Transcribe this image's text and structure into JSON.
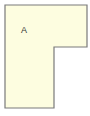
{
  "diagram": {
    "shape": "L-shape",
    "label": "A",
    "fill_color": "#fdfde0",
    "stroke_color": "#7a7a7a",
    "points": [
      [
        5,
        5
      ],
      [
        87,
        5
      ],
      [
        87,
        47
      ],
      [
        54,
        47
      ],
      [
        54,
        108
      ],
      [
        5,
        108
      ]
    ]
  }
}
